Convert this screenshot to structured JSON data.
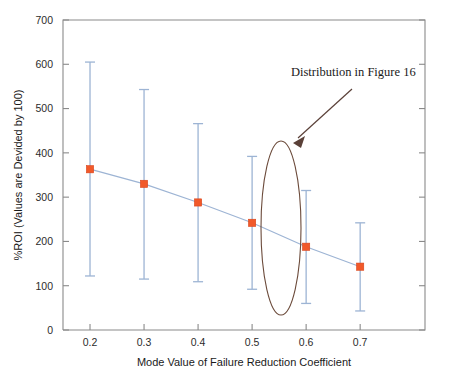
{
  "chart_data": {
    "type": "line",
    "title": "",
    "xlabel": "Mode Value of Failure Reduction Coefficient",
    "ylabel": "%ROI (Values are Devided by 100)",
    "x": [
      0.2,
      0.3,
      0.4,
      0.5,
      0.6,
      0.7
    ],
    "xtick_labels": [
      "0.2",
      "0.3",
      "0.4",
      "0.5",
      "0.6",
      "0.7"
    ],
    "ytick_labels": [
      "0",
      "100",
      "200",
      "300",
      "400",
      "500",
      "600",
      "700"
    ],
    "yticks": [
      0,
      100,
      200,
      300,
      400,
      500,
      600,
      700
    ],
    "xlim": [
      0.15,
      0.82
    ],
    "ylim": [
      0,
      700
    ],
    "grid": false,
    "legend": "none",
    "series": [
      {
        "name": "Mean %ROI",
        "marker": "square",
        "marker_color": "#f1592a",
        "line_color": "#9db4d4",
        "values": [
          363,
          330,
          288,
          242,
          188,
          143
        ],
        "error_low": [
          122,
          115,
          109,
          92,
          60,
          43
        ],
        "error_high": [
          605,
          543,
          466,
          392,
          315,
          242
        ]
      }
    ],
    "annotations": [
      {
        "text": "Distribution in Figure 16",
        "type": "arrow-callout",
        "points_to_x": 0.5,
        "color": "#5a4038"
      },
      {
        "text": "",
        "type": "ellipse-highlight",
        "centered_on_x": 0.5,
        "color": "#6b4a3a"
      }
    ]
  },
  "colors": {
    "marker": "#f1592a",
    "errorbar": "#9db4d4",
    "annotation": "#5a4038",
    "ellipse": "#6b4a3a",
    "axis": "#8a8a8a",
    "background": "#ffffff"
  },
  "labels": {
    "annotation_text": "Distribution in Figure 16",
    "x_axis_title": "Mode Value of Failure Reduction Coefficient",
    "y_axis_title": "%ROI (Values are Devided by 100)"
  }
}
